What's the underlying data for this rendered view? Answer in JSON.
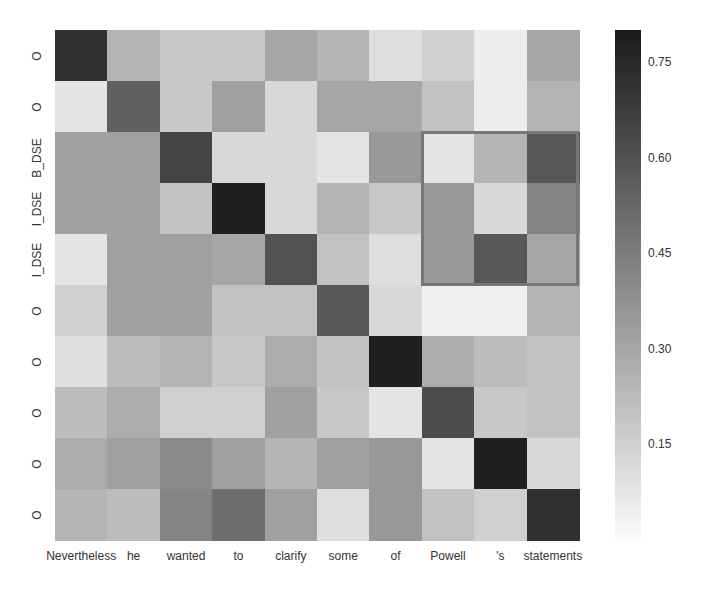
{
  "chart_data": {
    "type": "heatmap",
    "title": "",
    "xlabel": "",
    "ylabel": "",
    "x_labels": [
      "Nevertheless",
      "he",
      "wanted",
      "to",
      "clarify",
      "some",
      "of",
      "Powell",
      "'s",
      "statements"
    ],
    "y_labels": [
      "O",
      "O",
      "B_DSE",
      "I_DSE",
      "I_DSE",
      "O",
      "O",
      "O",
      "O",
      "O"
    ],
    "values": [
      [
        0.72,
        0.25,
        0.18,
        0.18,
        0.3,
        0.25,
        0.1,
        0.15,
        0.05,
        0.3
      ],
      [
        0.08,
        0.55,
        0.18,
        0.32,
        0.12,
        0.3,
        0.3,
        0.2,
        0.05,
        0.25
      ],
      [
        0.32,
        0.32,
        0.65,
        0.12,
        0.12,
        0.08,
        0.35,
        0.08,
        0.25,
        0.58
      ],
      [
        0.32,
        0.32,
        0.2,
        0.78,
        0.12,
        0.25,
        0.18,
        0.35,
        0.12,
        0.42
      ],
      [
        0.08,
        0.32,
        0.32,
        0.3,
        0.6,
        0.2,
        0.1,
        0.35,
        0.58,
        0.3
      ],
      [
        0.15,
        0.32,
        0.32,
        0.2,
        0.2,
        0.58,
        0.12,
        0.04,
        0.04,
        0.25
      ],
      [
        0.1,
        0.22,
        0.25,
        0.18,
        0.28,
        0.2,
        0.78,
        0.28,
        0.22,
        0.2
      ],
      [
        0.22,
        0.28,
        0.15,
        0.15,
        0.32,
        0.18,
        0.08,
        0.62,
        0.18,
        0.2
      ],
      [
        0.28,
        0.32,
        0.4,
        0.32,
        0.25,
        0.32,
        0.35,
        0.08,
        0.78,
        0.12
      ],
      [
        0.25,
        0.22,
        0.42,
        0.5,
        0.32,
        0.1,
        0.35,
        0.2,
        0.15,
        0.72
      ]
    ],
    "colorbar": {
      "min": 0.0,
      "max": 0.8,
      "ticks": [
        0.15,
        0.3,
        0.45,
        0.6,
        0.75
      ],
      "tick_labels": [
        "0.15",
        "0.30",
        "0.45",
        "0.60",
        "0.75"
      ],
      "color_low": "#fafafa",
      "color_high": "#1a1a1a"
    },
    "highlight_box": {
      "col_start": 7,
      "col_end": 9,
      "row_start": 2,
      "row_end": 4,
      "color": "#777777"
    },
    "grid": false,
    "legend_position": "right"
  }
}
